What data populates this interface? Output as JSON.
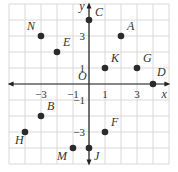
{
  "chart_data": {
    "type": "scatter",
    "title": "",
    "xlabel": "x",
    "ylabel": "y",
    "origin_label": "O",
    "xlim": [
      -5,
      5
    ],
    "ylim": [
      -5,
      5
    ],
    "grid": true,
    "x_ticks": [
      {
        "value": -3,
        "label": "-3"
      },
      {
        "value": -1,
        "label": "-1"
      },
      {
        "value": 1,
        "label": "1"
      },
      {
        "value": 3,
        "label": "3"
      }
    ],
    "y_ticks": [
      {
        "value": 3,
        "label": "3"
      },
      {
        "value": 1,
        "label": "1"
      },
      {
        "value": -1,
        "label": "-1"
      },
      {
        "value": -3,
        "label": "-3"
      }
    ],
    "points": [
      {
        "name": "A",
        "x": 2,
        "y": 3
      },
      {
        "name": "B",
        "x": -3,
        "y": -2
      },
      {
        "name": "C",
        "x": 0,
        "y": 4
      },
      {
        "name": "D",
        "x": 4,
        "y": 0
      },
      {
        "name": "E",
        "x": -2,
        "y": 2
      },
      {
        "name": "F",
        "x": 1,
        "y": -3
      },
      {
        "name": "G",
        "x": 3,
        "y": 1
      },
      {
        "name": "H",
        "x": -4,
        "y": -3
      },
      {
        "name": "J",
        "x": 0,
        "y": -4
      },
      {
        "name": "K",
        "x": 1,
        "y": 1
      },
      {
        "name": "M",
        "x": -1,
        "y": -4
      },
      {
        "name": "N",
        "x": -3,
        "y": 3
      }
    ],
    "label_offsets": {
      "A": [
        6,
        -6
      ],
      "B": [
        6,
        -6
      ],
      "C": [
        6,
        -4
      ],
      "D": [
        4,
        -8
      ],
      "E": [
        6,
        -6
      ],
      "F": [
        6,
        -6
      ],
      "G": [
        6,
        -6
      ],
      "H": [
        -10,
        12
      ],
      "J": [
        5,
        12
      ],
      "K": [
        6,
        -6
      ],
      "M": [
        -16,
        12
      ],
      "N": [
        -14,
        -6
      ]
    },
    "colors": {
      "grid": "#d9d9d9",
      "axis": "#222222",
      "point": "#2b2b2b"
    }
  }
}
